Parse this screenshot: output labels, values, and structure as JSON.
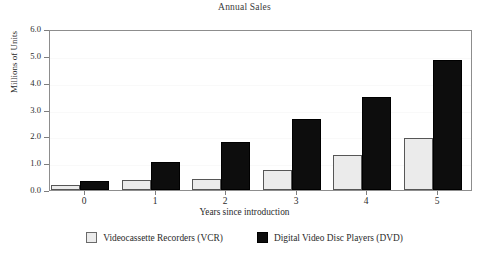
{
  "chart_data": {
    "type": "bar",
    "title": "Annual Sales",
    "xlabel": "Years since introduction",
    "ylabel": "Millions of Units",
    "categories": [
      "0",
      "1",
      "2",
      "3",
      "4",
      "5"
    ],
    "series": [
      {
        "name": "Videocassette Recorders (VCR)",
        "color": "#ebebeb",
        "values": [
          0.2,
          0.38,
          0.42,
          0.75,
          1.3,
          1.95
        ]
      },
      {
        "name": "Digital Video Disc Players (DVD)",
        "color": "#0d0d0d",
        "values": [
          0.35,
          1.05,
          1.8,
          2.65,
          3.45,
          4.85
        ]
      }
    ],
    "ylim": [
      0.0,
      6.0
    ],
    "yticks": [
      "0.0",
      "1.0",
      "2.0",
      "3.0",
      "4.0",
      "5.0",
      "6.0"
    ],
    "ytick_values": [
      0.0,
      1.0,
      2.0,
      3.0,
      4.0,
      5.0,
      6.0
    ],
    "grid": false,
    "legend_position": "bottom-center"
  },
  "legend": {
    "entries": [
      {
        "label": "Videocassette Recorders (VCR)"
      },
      {
        "label": "Digital Video Disc Players (DVD)"
      }
    ]
  }
}
